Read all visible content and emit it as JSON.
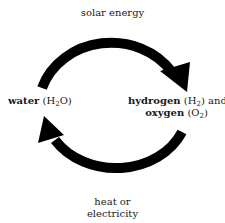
{
  "diagram": {
    "arrow_color": "#000000",
    "nodes": {
      "left": {
        "name": "water",
        "formula_prefix": "H",
        "formula_sub": "2",
        "formula_suffix": "O"
      },
      "right": {
        "line1_name": "hydrogen",
        "line1_formula_prefix": "H",
        "line1_formula_sub": "2",
        "line1_connector": "and",
        "line2_name": "oxygen",
        "line2_formula_prefix": "O",
        "line2_formula_sub": "2"
      }
    },
    "edges": {
      "top": {
        "label": "solar energy",
        "from": "water",
        "to": "hydrogen and oxygen",
        "direction": "clockwise"
      },
      "bottom": {
        "label_line1": "heat or",
        "label_line2": "electricity",
        "from": "hydrogen and oxygen",
        "to": "water",
        "direction": "clockwise"
      }
    }
  }
}
